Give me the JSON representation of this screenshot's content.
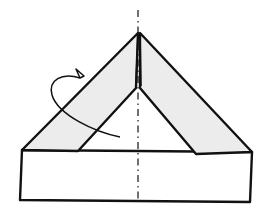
{
  "diagram": {
    "type": "origami-fold-step",
    "colors": {
      "line": "#111111",
      "flap_fill": "#ececec",
      "paper_fill": "#ffffff",
      "background": "#ffffff"
    },
    "elements": [
      {
        "name": "center-axis",
        "style": "dash-dot"
      },
      {
        "name": "left-flap",
        "shaded": true
      },
      {
        "name": "right-flap",
        "shaded": true
      },
      {
        "name": "base-rectangle",
        "shaded": false
      },
      {
        "name": "fold-behind-arrow",
        "direction": "behind"
      }
    ]
  }
}
